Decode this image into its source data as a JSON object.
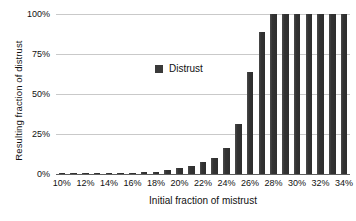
{
  "chart_data": {
    "type": "bar",
    "title": "",
    "xlabel": "Initial fraction of mistrust",
    "ylabel": "Resulting fraction of distrust",
    "categories": [
      "10%",
      "11%",
      "12%",
      "13%",
      "14%",
      "15%",
      "16%",
      "17%",
      "18%",
      "19%",
      "20%",
      "21%",
      "22%",
      "23%",
      "24%",
      "25%",
      "26%",
      "27%",
      "28%",
      "29%",
      "30%",
      "31%",
      "32%",
      "33%",
      "34%"
    ],
    "values": [
      0,
      0,
      0,
      0,
      0,
      0,
      0.5,
      1,
      1.5,
      2.5,
      3.5,
      5,
      7.5,
      10,
      16,
      31,
      64,
      89,
      100,
      100,
      100,
      100,
      100,
      100,
      100
    ],
    "series": [
      {
        "name": "Distrust",
        "color": "#3a3a3a",
        "values": [
          0,
          0,
          0,
          0,
          0,
          0,
          0.5,
          1,
          1.5,
          2.5,
          3.5,
          5,
          7.5,
          10,
          16,
          31,
          64,
          89,
          100,
          100,
          100,
          100,
          100,
          100,
          100
        ]
      }
    ],
    "ylim": [
      0,
      100
    ],
    "yticks": [
      0,
      25,
      50,
      75,
      100
    ],
    "ytick_labels": [
      "0%",
      "25%",
      "50%",
      "75%",
      "100%"
    ],
    "xtick_labels": [
      "10%",
      "12%",
      "14%",
      "16%",
      "18%",
      "20%",
      "22%",
      "24%",
      "26%",
      "28%",
      "30%",
      "32%",
      "34%"
    ],
    "xtick_indices": [
      0,
      2,
      4,
      6,
      8,
      10,
      12,
      14,
      16,
      18,
      20,
      22,
      24
    ],
    "grid": true,
    "legend_position": "inside-center",
    "legend_entries": [
      "Distrust"
    ]
  },
  "legend": {
    "label": "Distrust",
    "swatch_name": "legend-swatch-distrust"
  },
  "axes": {
    "y_title": "Resulting fraction of distrust",
    "x_title": "Initial fraction of mistrust"
  },
  "colors": {
    "bar": "#3a3a3a",
    "grid": "#c9c9c9",
    "axis": "#5e5e5e",
    "text": "#111111",
    "background": "#ffffff"
  }
}
